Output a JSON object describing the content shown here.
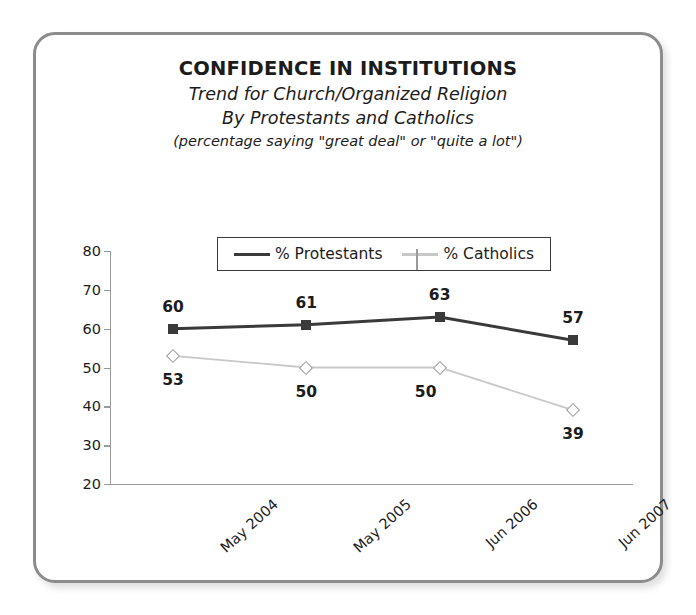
{
  "chart_data": {
    "type": "line",
    "title": "CONFIDENCE IN INSTITUTIONS",
    "subtitle_1": "Trend for Church/Organized Religion",
    "subtitle_2": "By Protestants and Catholics",
    "subtitle_3": "(percentage saying \"great deal\" or \"quite a lot\")",
    "categories": [
      "May 2004",
      "May 2005",
      "Jun 2006",
      "Jun 2007"
    ],
    "series": [
      {
        "name": "% Protestants",
        "values": [
          60,
          61,
          63,
          57
        ],
        "color": "#3a3a3a",
        "marker": "filled-square",
        "label_position": "above"
      },
      {
        "name": "% Catholics",
        "values": [
          53,
          50,
          50,
          39
        ],
        "color": "#c8c8c8",
        "marker": "open-diamond",
        "label_position": "below"
      }
    ],
    "xlabel": "",
    "ylabel": "",
    "ylim": [
      20,
      80
    ],
    "yticks": [
      20,
      30,
      40,
      50,
      60,
      70,
      80
    ],
    "grid": false,
    "legend_position": "top-center"
  },
  "legend": {
    "entries": [
      {
        "label": "% Protestants",
        "marker": "filled-square-icon"
      },
      {
        "label": "% Catholics",
        "marker": "open-diamond-icon"
      }
    ]
  }
}
